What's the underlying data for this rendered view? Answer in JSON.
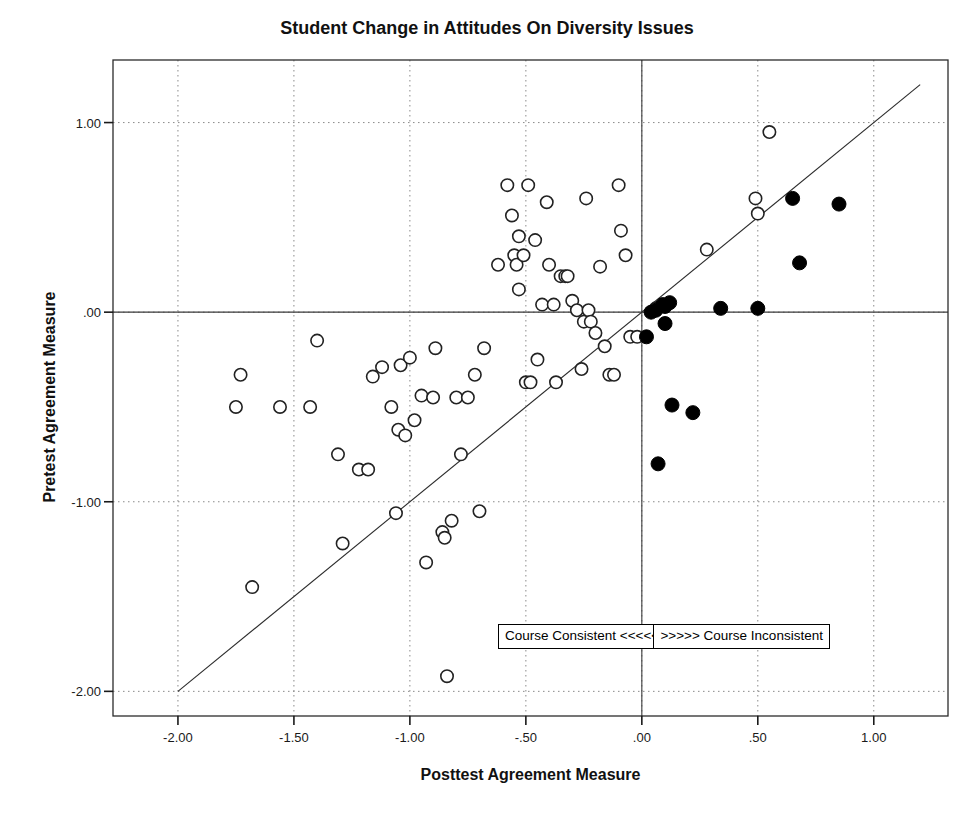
{
  "chart_data": {
    "type": "scatter",
    "title": "Student Change in Attitudes On Diversity Issues",
    "xlabel": "Posttest Agreement Measure",
    "ylabel": "Pretest Agreement Measure",
    "xlim": [
      -2.28,
      1.32
    ],
    "ylim": [
      -2.13,
      1.33
    ],
    "xticks": [
      -2.0,
      -1.5,
      -1.0,
      -0.5,
      0.0,
      0.5,
      1.0
    ],
    "xticklabels": [
      "-2.00",
      "-1.50",
      "-1.00",
      "-.50",
      ".00",
      ".50",
      "1.00"
    ],
    "yticks": [
      1.0,
      0.0,
      -1.0,
      -2.0
    ],
    "yticklabels": [
      "1.00",
      ".00",
      "-1.00",
      "-2.00"
    ],
    "grid": true,
    "grid_style": "dotted",
    "reference_line": {
      "name": "identity-line",
      "description": "y = x diagonal reference line",
      "x1": -2.0,
      "y1": -2.0,
      "x2": 1.2,
      "y2": 1.2
    },
    "zero_lines": {
      "vertical_x": 0.0,
      "horizontal_y": 0.0
    },
    "legend": null,
    "annotations": [
      {
        "name": "course-consistent-box",
        "text": "Course Consistent <<<<<",
        "x": -0.62,
        "y": -1.71
      },
      {
        "name": "course-inconsistent-box",
        "text": ">>>>> Course Inconsistent",
        "x": 0.05,
        "y": -1.71
      }
    ],
    "series": [
      {
        "name": "Course Consistent (hollow)",
        "marker": "open-circle",
        "color": "#222222",
        "fill": "#ffffff",
        "points": [
          [
            -1.73,
            -0.33
          ],
          [
            -1.75,
            -0.5
          ],
          [
            -1.68,
            -1.45
          ],
          [
            -1.56,
            -0.5
          ],
          [
            -1.43,
            -0.5
          ],
          [
            -1.4,
            -0.15
          ],
          [
            -1.31,
            -0.75
          ],
          [
            -1.29,
            -1.22
          ],
          [
            -1.22,
            -0.83
          ],
          [
            -1.18,
            -0.83
          ],
          [
            -1.16,
            -0.34
          ],
          [
            -1.12,
            -0.29
          ],
          [
            -1.08,
            -0.5
          ],
          [
            -1.06,
            -1.06
          ],
          [
            -1.05,
            -0.62
          ],
          [
            -1.04,
            -0.28
          ],
          [
            -1.02,
            -0.65
          ],
          [
            -1.0,
            -0.24
          ],
          [
            -0.98,
            -0.57
          ],
          [
            -0.95,
            -0.44
          ],
          [
            -0.93,
            -1.32
          ],
          [
            -0.9,
            -0.45
          ],
          [
            -0.89,
            -0.19
          ],
          [
            -0.86,
            -1.16
          ],
          [
            -0.85,
            -1.19
          ],
          [
            -0.84,
            -1.92
          ],
          [
            -0.82,
            -1.1
          ],
          [
            -0.8,
            -0.45
          ],
          [
            -0.78,
            -0.75
          ],
          [
            -0.75,
            -0.45
          ],
          [
            -0.72,
            -0.33
          ],
          [
            -0.7,
            -1.05
          ],
          [
            -0.68,
            -0.19
          ],
          [
            -0.62,
            0.25
          ],
          [
            -0.58,
            0.67
          ],
          [
            -0.56,
            0.51
          ],
          [
            -0.55,
            0.3
          ],
          [
            -0.54,
            0.25
          ],
          [
            -0.53,
            0.4
          ],
          [
            -0.53,
            0.12
          ],
          [
            -0.51,
            0.3
          ],
          [
            -0.5,
            -0.37
          ],
          [
            -0.49,
            0.67
          ],
          [
            -0.48,
            -0.37
          ],
          [
            -0.46,
            0.38
          ],
          [
            -0.45,
            -0.25
          ],
          [
            -0.43,
            0.04
          ],
          [
            -0.41,
            0.58
          ],
          [
            -0.4,
            0.25
          ],
          [
            -0.38,
            0.04
          ],
          [
            -0.37,
            -0.37
          ],
          [
            -0.35,
            0.19
          ],
          [
            -0.33,
            0.19
          ],
          [
            -0.32,
            0.19
          ],
          [
            -0.3,
            0.06
          ],
          [
            -0.28,
            0.01
          ],
          [
            -0.26,
            -0.3
          ],
          [
            -0.25,
            -0.05
          ],
          [
            -0.24,
            0.6
          ],
          [
            -0.23,
            0.01
          ],
          [
            -0.22,
            -0.05
          ],
          [
            -0.2,
            -0.11
          ],
          [
            -0.18,
            0.24
          ],
          [
            -0.16,
            -0.18
          ],
          [
            -0.14,
            -0.33
          ],
          [
            -0.12,
            -0.33
          ],
          [
            -0.1,
            0.67
          ],
          [
            -0.09,
            0.43
          ],
          [
            -0.07,
            0.3
          ],
          [
            -0.05,
            -0.13
          ],
          [
            -0.02,
            -0.13
          ],
          [
            0.06,
            0.02
          ],
          [
            0.28,
            0.33
          ],
          [
            0.49,
            0.6
          ],
          [
            0.5,
            0.52
          ],
          [
            0.55,
            0.95
          ]
        ]
      },
      {
        "name": "Course Inconsistent (filled)",
        "marker": "filled-circle",
        "color": "#000000",
        "fill": "#000000",
        "points": [
          [
            0.02,
            -0.13
          ],
          [
            0.04,
            0.0
          ],
          [
            0.06,
            0.01
          ],
          [
            0.07,
            -0.8
          ],
          [
            0.09,
            0.04
          ],
          [
            0.1,
            0.03
          ],
          [
            0.1,
            -0.06
          ],
          [
            0.12,
            0.05
          ],
          [
            0.13,
            -0.49
          ],
          [
            0.22,
            -0.53
          ],
          [
            0.34,
            0.02
          ],
          [
            0.5,
            0.02
          ],
          [
            0.65,
            0.6
          ],
          [
            0.68,
            0.26
          ],
          [
            0.85,
            0.57
          ]
        ]
      }
    ]
  },
  "title": "Student Change in Attitudes On Diversity Issues",
  "axes": {
    "x_title": "Posttest Agreement Measure",
    "y_title": "Pretest Agreement Measure"
  }
}
